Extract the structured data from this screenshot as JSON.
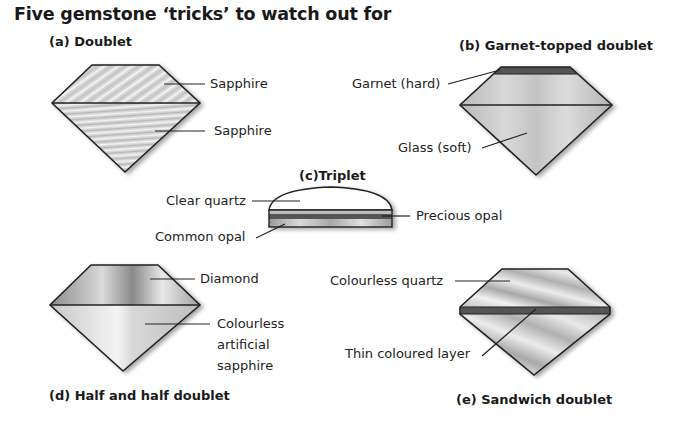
{
  "title": "Five gemstone ‘tricks’ to watch out for",
  "figures": [
    {
      "id": "a",
      "caption": "(a) Doublet",
      "labels": [
        "Sapphire",
        "Sapphire"
      ]
    },
    {
      "id": "b",
      "caption": "(b) Garnet-topped doublet",
      "labels": [
        "Garnet (hard)",
        "Glass (soft)"
      ]
    },
    {
      "id": "c",
      "caption": "(c)Triplet",
      "labels": [
        "Clear quartz",
        "Common opal",
        "Precious opal"
      ]
    },
    {
      "id": "d",
      "caption": "(d) Half and half doublet",
      "labels": [
        "Diamond",
        "Colourless",
        "artificial",
        "sapphire"
      ]
    },
    {
      "id": "e",
      "caption": "(e) Sandwich doublet",
      "labels": [
        "Colourless quartz",
        "Thin coloured layer"
      ]
    }
  ],
  "colors": {
    "outline": "#222222",
    "garnet": "#555555",
    "stone_light": "#e2e2e2",
    "stone_mid": "#bcbcbc",
    "stone_dark": "#8a8a8a"
  }
}
